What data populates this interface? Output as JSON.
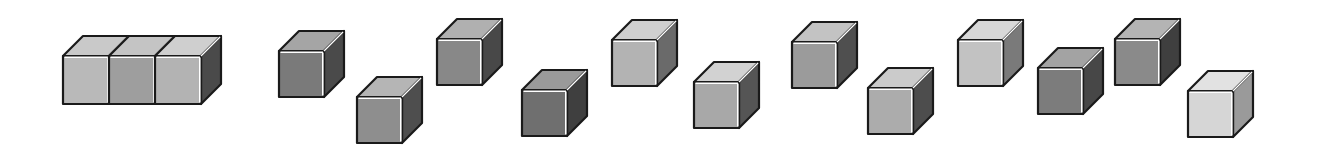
{
  "figure": {
    "depth_dx": 20,
    "depth_dy": -20,
    "edge_color": "#1a1a1a",
    "highlight_color": "#ffffff"
  },
  "joined_group": {
    "label": "row-of-three-cubes",
    "x": 63,
    "y": 56,
    "unit_width": 46,
    "height": 48,
    "cubes": [
      {
        "front": "#b9b9b9",
        "top": "#c9c9c9",
        "side": "#5a5a5a"
      },
      {
        "front": "#9e9e9e",
        "top": "#c4c4c4",
        "side": "#5a5a5a"
      },
      {
        "front": "#b3b3b3",
        "top": "#cfcfcf",
        "side": "#4a4a4a"
      }
    ]
  },
  "cubes": [
    {
      "id": "cube-1",
      "x": 279,
      "y": 51,
      "w": 45,
      "h": 46,
      "front": "#7a7a7a",
      "top": "#a5a5a5",
      "side": "#4a4a4a"
    },
    {
      "id": "cube-2",
      "x": 357,
      "y": 97,
      "w": 45,
      "h": 46,
      "front": "#8e8e8e",
      "top": "#b5b5b5",
      "side": "#4e4e4e"
    },
    {
      "id": "cube-3",
      "x": 437,
      "y": 39,
      "w": 45,
      "h": 46,
      "front": "#888888",
      "top": "#b0b0b0",
      "side": "#484848"
    },
    {
      "id": "cube-4",
      "x": 522,
      "y": 90,
      "w": 45,
      "h": 46,
      "front": "#6f6f6f",
      "top": "#9a9a9a",
      "side": "#3f3f3f"
    },
    {
      "id": "cube-5",
      "x": 612,
      "y": 40,
      "w": 45,
      "h": 46,
      "front": "#b3b3b3",
      "top": "#cfcfcf",
      "side": "#6a6a6a"
    },
    {
      "id": "cube-6",
      "x": 694,
      "y": 82,
      "w": 45,
      "h": 46,
      "front": "#a8a8a8",
      "top": "#d2d2d2",
      "side": "#555555"
    },
    {
      "id": "cube-7",
      "x": 792,
      "y": 42,
      "w": 45,
      "h": 46,
      "front": "#9b9b9b",
      "top": "#c3c3c3",
      "side": "#4f4f4f"
    },
    {
      "id": "cube-8",
      "x": 868,
      "y": 88,
      "w": 45,
      "h": 46,
      "front": "#acacac",
      "top": "#cbcbcb",
      "side": "#4d4d4d"
    },
    {
      "id": "cube-9",
      "x": 958,
      "y": 40,
      "w": 45,
      "h": 46,
      "front": "#c2c2c2",
      "top": "#d8d8d8",
      "side": "#7a7a7a"
    },
    {
      "id": "cube-10",
      "x": 1038,
      "y": 68,
      "w": 45,
      "h": 46,
      "front": "#7c7c7c",
      "top": "#a3a3a3",
      "side": "#474747"
    },
    {
      "id": "cube-11",
      "x": 1115,
      "y": 39,
      "w": 45,
      "h": 46,
      "front": "#8a8a8a",
      "top": "#b4b4b4",
      "side": "#3f3f3f"
    },
    {
      "id": "cube-12",
      "x": 1188,
      "y": 91,
      "w": 45,
      "h": 46,
      "front": "#d6d6d6",
      "top": "#e2e2e2",
      "side": "#9a9a9a"
    }
  ]
}
